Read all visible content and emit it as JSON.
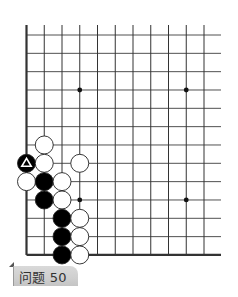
{
  "board": {
    "origin_x": 26.5,
    "origin_y": 35,
    "spacing_x": 17.75,
    "spacing_y": 18.33,
    "cols": 11,
    "rows": 13,
    "vertical_top": 25,
    "horizontal_right": 221,
    "edges": {
      "left": true,
      "bottom": true
    },
    "stone_radius": 9,
    "hoshi": [
      {
        "col": 3,
        "row": 3
      },
      {
        "col": 9,
        "row": 3
      },
      {
        "col": 3,
        "row": 9
      },
      {
        "col": 9,
        "row": 9
      }
    ],
    "stones": [
      {
        "color": "white",
        "col": 1,
        "row": 6
      },
      {
        "color": "black",
        "col": 0,
        "row": 7,
        "marker": "triangle"
      },
      {
        "color": "white",
        "col": 1,
        "row": 7
      },
      {
        "color": "white",
        "col": 3,
        "row": 7
      },
      {
        "color": "white",
        "col": 0,
        "row": 8
      },
      {
        "color": "black",
        "col": 1,
        "row": 8
      },
      {
        "color": "white",
        "col": 2,
        "row": 8
      },
      {
        "color": "black",
        "col": 1,
        "row": 9
      },
      {
        "color": "white",
        "col": 2,
        "row": 9
      },
      {
        "color": "black",
        "col": 2,
        "row": 10
      },
      {
        "color": "white",
        "col": 3,
        "row": 10
      },
      {
        "color": "black",
        "col": 2,
        "row": 11
      },
      {
        "color": "white",
        "col": 3,
        "row": 11
      },
      {
        "color": "black",
        "col": 2,
        "row": 12
      },
      {
        "color": "white",
        "col": 3,
        "row": 12
      }
    ],
    "colors": {
      "line": "#333333",
      "black_stone": "#000000",
      "white_stone": "#ffffff",
      "stone_outline": "#222222",
      "marker": "#ffffff"
    }
  },
  "problem_label": {
    "text": "问题 50"
  }
}
